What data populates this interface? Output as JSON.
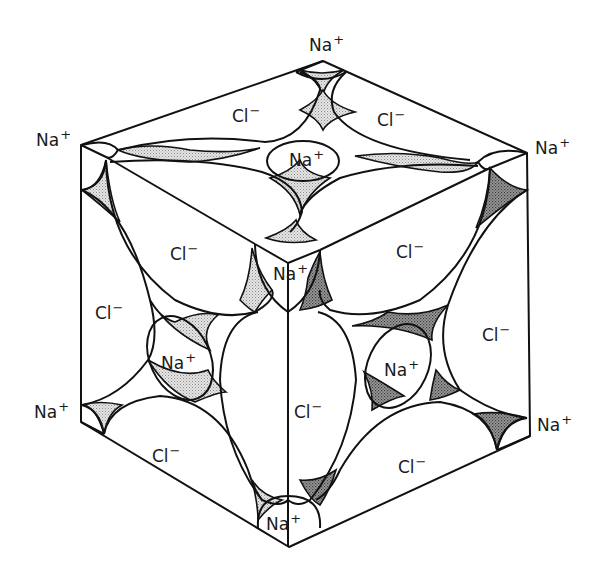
{
  "diagram": {
    "title": "",
    "colors": {
      "line": "#111111",
      "background": "#ffffff",
      "light_stipple": "#d6d6d6",
      "dark_stipple": "#8a8a8a"
    },
    "ions": {
      "na": {
        "symbol": "Na",
        "charge": "+"
      },
      "cl": {
        "symbol": "Cl",
        "charge": "−"
      }
    },
    "labels": [
      {
        "id": "na-top-vertex",
        "ion": "na",
        "x": 309,
        "y": 37
      },
      {
        "id": "na-left-top-corner",
        "ion": "na",
        "x": 36,
        "y": 132
      },
      {
        "id": "na-right-top-corner",
        "ion": "na",
        "x": 535,
        "y": 140
      },
      {
        "id": "na-top-face-center",
        "ion": "na",
        "x": 289,
        "y": 152
      },
      {
        "id": "cl-top-face-left",
        "ion": "cl",
        "x": 232,
        "y": 108
      },
      {
        "id": "cl-top-face-right",
        "ion": "cl",
        "x": 377,
        "y": 112
      },
      {
        "id": "cl-left-face-upper",
        "ion": "cl",
        "x": 170,
        "y": 246
      },
      {
        "id": "cl-right-face-upper",
        "ion": "cl",
        "x": 396,
        "y": 244
      },
      {
        "id": "na-front-top-vertex",
        "ion": "na",
        "x": 273,
        "y": 266
      },
      {
        "id": "cl-left-face-left-edge",
        "ion": "cl",
        "x": 95,
        "y": 305
      },
      {
        "id": "cl-right-face-right-edge",
        "ion": "cl",
        "x": 482,
        "y": 327
      },
      {
        "id": "na-left-face-center",
        "ion": "na",
        "x": 161,
        "y": 355
      },
      {
        "id": "na-right-face-center",
        "ion": "na",
        "x": 384,
        "y": 362
      },
      {
        "id": "cl-front-edge-center",
        "ion": "cl",
        "x": 294,
        "y": 404
      },
      {
        "id": "na-left-bottom-corner",
        "ion": "na",
        "x": 34,
        "y": 404
      },
      {
        "id": "cl-left-face-bottom",
        "ion": "cl",
        "x": 152,
        "y": 448
      },
      {
        "id": "cl-right-face-bottom",
        "ion": "cl",
        "x": 398,
        "y": 459
      },
      {
        "id": "na-right-bottom-corner",
        "ion": "na",
        "x": 537,
        "y": 417
      },
      {
        "id": "na-bottom-vertex",
        "ion": "na",
        "x": 266,
        "y": 516
      }
    ]
  }
}
